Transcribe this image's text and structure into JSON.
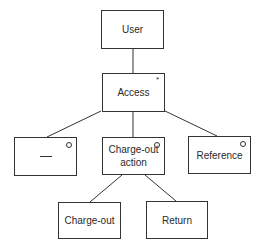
{
  "diagram": {
    "nodes": [
      {
        "id": "user",
        "label": "User",
        "marker": ""
      },
      {
        "id": "access",
        "label": "Access",
        "marker": "*"
      },
      {
        "id": "blank",
        "label": "",
        "marker": "o"
      },
      {
        "id": "chargeout_action",
        "label": "Charge-out action",
        "marker": "o"
      },
      {
        "id": "reference",
        "label": "Reference",
        "marker": "o"
      },
      {
        "id": "chargeout",
        "label": "Charge-out",
        "marker": ""
      },
      {
        "id": "return",
        "label": "Return",
        "marker": ""
      }
    ],
    "edges": [
      {
        "from": "user",
        "to": "access"
      },
      {
        "from": "access",
        "to": "blank"
      },
      {
        "from": "access",
        "to": "chargeout_action"
      },
      {
        "from": "access",
        "to": "reference"
      },
      {
        "from": "chargeout_action",
        "to": "chargeout"
      },
      {
        "from": "chargeout_action",
        "to": "return"
      }
    ],
    "labels": {
      "user": "User",
      "access": "Access",
      "access_marker": "*",
      "chargeout_action_line1": "Charge-out",
      "chargeout_action_line2": "action",
      "reference": "Reference",
      "chargeout": "Charge-out",
      "return": "Return"
    }
  }
}
